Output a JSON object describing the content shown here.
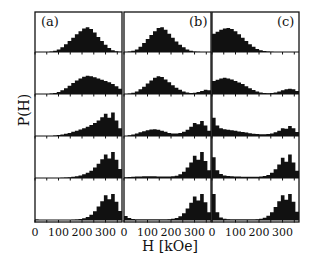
{
  "chart_data": {
    "type": "bar",
    "subtype": "histogram-grid",
    "note": "Y-axis is unlabeled (no tick values). All bin heights and peak positions below are relative-shape estimates read visually from the figure, not measured data. Only tick labels, axis titles and panel labels are legible text.",
    "xlabel": "H [kOe]",
    "ylabel": "P(H)",
    "xlim": [
      0,
      370
    ],
    "x_ticks": [
      0,
      100,
      200,
      300
    ],
    "x_tick_labels": [
      "0",
      "100",
      "200",
      "300"
    ],
    "rows": 5,
    "columns": 3,
    "grid": false,
    "panels": [
      {
        "label": "(a)",
        "rows": [
          {
            "description": "broad hump centered ~230 kOe (estimated)",
            "shape": [
              0,
              0,
              0,
              0,
              0.02,
              0.05,
              0.1,
              0.18,
              0.3,
              0.42,
              0.55,
              0.68,
              0.8,
              0.9,
              0.95,
              0.88,
              0.75,
              0.58,
              0.42,
              0.28,
              0.15,
              0.07,
              0.03,
              0.01
            ]
          },
          {
            "description": "broad hump, slightly shifted higher (estimated)",
            "shape": [
              0,
              0,
              0,
              0,
              0.02,
              0.04,
              0.08,
              0.14,
              0.22,
              0.32,
              0.42,
              0.52,
              0.6,
              0.66,
              0.7,
              0.68,
              0.64,
              0.6,
              0.55,
              0.5,
              0.45,
              0.38,
              0.3,
              0.2
            ]
          },
          {
            "description": "rising toward high field, spikes near 330-350 (estimated)",
            "shape": [
              0,
              0,
              0,
              0,
              0,
              0.02,
              0.04,
              0.06,
              0.09,
              0.12,
              0.16,
              0.2,
              0.25,
              0.3,
              0.36,
              0.42,
              0.5,
              0.6,
              0.72,
              0.85,
              0.7,
              0.9,
              0.6,
              0.3
            ]
          },
          {
            "description": "concentrated near 300-350 with spikes (estimated)",
            "shape": [
              0,
              0,
              0,
              0,
              0,
              0,
              0,
              0.01,
              0.02,
              0.03,
              0.05,
              0.07,
              0.1,
              0.14,
              0.2,
              0.28,
              0.4,
              0.55,
              0.72,
              0.9,
              0.75,
              1.0,
              0.7,
              0.35
            ]
          },
          {
            "description": "sharply concentrated near 300-350 (estimated)",
            "shape": [
              0.02,
              0,
              0,
              0,
              0,
              0,
              0,
              0,
              0,
              0,
              0.01,
              0.02,
              0.04,
              0.07,
              0.12,
              0.2,
              0.34,
              0.52,
              0.72,
              0.95,
              0.8,
              1.0,
              0.7,
              0.35
            ]
          }
        ]
      },
      {
        "label": "(b)",
        "rows": [
          {
            "description": "hump centered ~150 kOe (estimated)",
            "shape": [
              0,
              0.02,
              0.05,
              0.1,
              0.2,
              0.35,
              0.5,
              0.65,
              0.8,
              0.92,
              0.95,
              0.85,
              0.7,
              0.55,
              0.4,
              0.28,
              0.18,
              0.1,
              0.05,
              0.02,
              0.01,
              0,
              0,
              0
            ]
          },
          {
            "description": "hump ~150 kOe plus small bump near 340 (estimated)",
            "shape": [
              0,
              0.02,
              0.05,
              0.1,
              0.18,
              0.28,
              0.4,
              0.52,
              0.62,
              0.68,
              0.65,
              0.56,
              0.45,
              0.34,
              0.24,
              0.16,
              0.1,
              0.06,
              0.04,
              0.05,
              0.08,
              0.12,
              0.16,
              0.14
            ]
          },
          {
            "description": "low hump ~120 and rising high-field peak ~320-350 (estimated)",
            "shape": [
              0,
              0.03,
              0.06,
              0.1,
              0.14,
              0.18,
              0.22,
              0.25,
              0.26,
              0.24,
              0.2,
              0.16,
              0.12,
              0.1,
              0.1,
              0.12,
              0.16,
              0.24,
              0.36,
              0.5,
              0.45,
              0.58,
              0.4,
              0.2
            ]
          },
          {
            "description": "flat low floor, strong peak ~300-350 (estimated)",
            "shape": [
              0.03,
              0.04,
              0.05,
              0.06,
              0.06,
              0.07,
              0.07,
              0.07,
              0.07,
              0.06,
              0.06,
              0.06,
              0.06,
              0.07,
              0.09,
              0.14,
              0.24,
              0.4,
              0.6,
              0.85,
              0.7,
              1.0,
              0.65,
              0.3
            ]
          },
          {
            "description": "small spike near 0, strong peak ~300-350 (estimated)",
            "shape": [
              0.15,
              0.08,
              0.04,
              0.02,
              0.02,
              0.02,
              0.02,
              0.02,
              0.02,
              0.02,
              0.02,
              0.02,
              0.03,
              0.05,
              0.08,
              0.14,
              0.26,
              0.44,
              0.66,
              0.9,
              0.75,
              1.0,
              0.68,
              0.3
            ]
          }
        ]
      },
      {
        "label": "(c)",
        "rows": [
          {
            "description": "hump near low field ~50-100 kOe (estimated)",
            "shape": [
              0.7,
              0.78,
              0.85,
              0.9,
              0.92,
              0.88,
              0.8,
              0.68,
              0.55,
              0.42,
              0.3,
              0.2,
              0.12,
              0.07,
              0.04,
              0.02,
              0.01,
              0,
              0,
              0,
              0,
              0,
              0,
              0
            ]
          },
          {
            "description": "low-field hump with small high-field bump ~340 (estimated)",
            "shape": [
              0.5,
              0.55,
              0.6,
              0.62,
              0.6,
              0.56,
              0.5,
              0.44,
              0.38,
              0.3,
              0.22,
              0.15,
              0.1,
              0.06,
              0.04,
              0.03,
              0.04,
              0.06,
              0.1,
              0.14,
              0.18,
              0.2,
              0.18,
              0.12
            ]
          },
          {
            "description": "spike at 0, declining floor, high-field peak ~330-350 (estimated)",
            "shape": [
              0.7,
              0.4,
              0.3,
              0.26,
              0.24,
              0.22,
              0.2,
              0.17,
              0.15,
              0.13,
              0.11,
              0.09,
              0.08,
              0.07,
              0.07,
              0.08,
              0.1,
              0.14,
              0.2,
              0.3,
              0.28,
              0.38,
              0.3,
              0.15
            ]
          },
          {
            "description": "spike at 0, low floor, strong peak ~300-350 (estimated)",
            "shape": [
              0.8,
              0.3,
              0.15,
              0.1,
              0.08,
              0.07,
              0.06,
              0.06,
              0.05,
              0.05,
              0.05,
              0.05,
              0.05,
              0.06,
              0.08,
              0.12,
              0.2,
              0.34,
              0.52,
              0.78,
              0.62,
              0.9,
              0.6,
              0.28
            ]
          },
          {
            "description": "spike at 0, nearly empty middle, strong peak ~300-350 (estimated)",
            "shape": [
              1.0,
              0.3,
              0.1,
              0.05,
              0.03,
              0.02,
              0.02,
              0.02,
              0.02,
              0.02,
              0.02,
              0.02,
              0.03,
              0.05,
              0.09,
              0.16,
              0.3,
              0.5,
              0.72,
              0.95,
              0.78,
              1.0,
              0.7,
              0.32
            ]
          }
        ]
      }
    ]
  },
  "labels": {
    "ylabel": "P(H)",
    "xlabel": "H [kOe]",
    "panel_labels": [
      "(a)",
      "(b)",
      "(c)"
    ],
    "tick_labels": [
      "0",
      "100",
      "200",
      "300"
    ]
  }
}
